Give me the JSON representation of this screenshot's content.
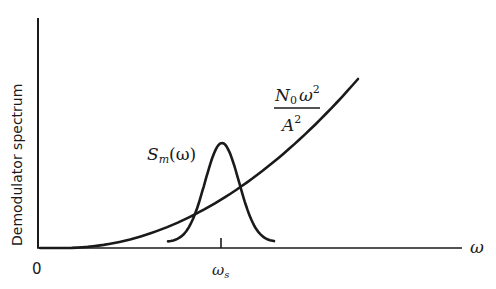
{
  "diagram": {
    "type": "spectrum-sketch",
    "y_axis_label": "Demodulator spectrum",
    "x_axis_label": "ω",
    "origin_label": "0",
    "x_tick_label": {
      "main": "ω",
      "sub": "s"
    },
    "curves": [
      {
        "name": "noise-spectrum",
        "shape": "parabola",
        "label": {
          "numerator_main": "N",
          "numerator_sub": "0",
          "numerator_var": "ω",
          "numerator_exp": "2",
          "denominator_main": "A",
          "denominator_exp": "2"
        }
      },
      {
        "name": "signal-spectrum",
        "shape": "bell",
        "centered_at": "ω_s",
        "label": {
          "main": "S",
          "sub": "m",
          "arg": "(ω)"
        }
      }
    ],
    "colors": {
      "ink": "#1a1a1a",
      "background": "#ffffff"
    }
  }
}
